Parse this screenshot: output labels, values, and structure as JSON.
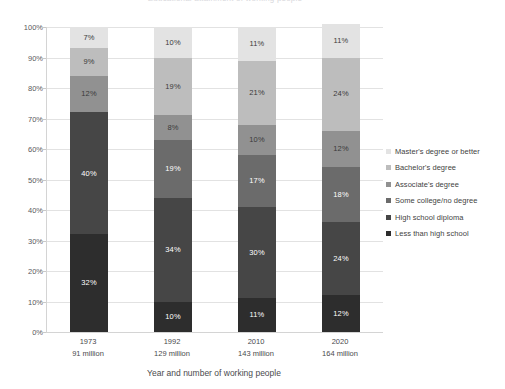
{
  "chart_data": {
    "type": "bar",
    "stacked": true,
    "stack_mode": "percent",
    "title": "Educational attainment of working people",
    "xlabel": "Year and number of working people",
    "ylabel": "",
    "ylim": [
      0,
      100
    ],
    "ytick_labels": [
      "0%",
      "10%",
      "20%",
      "30%",
      "40%",
      "50%",
      "60%",
      "70%",
      "80%",
      "90%",
      "100%"
    ],
    "ytick_values": [
      0,
      10,
      20,
      30,
      40,
      50,
      60,
      70,
      80,
      90,
      100
    ],
    "grid": true,
    "legend_position": "right",
    "categories": [
      "1973",
      "1992",
      "2010",
      "2020"
    ],
    "category_sublabels": [
      "91 million",
      "129 million",
      "143 million",
      "164 million"
    ],
    "series": [
      {
        "name": "Less than high school",
        "color": "#2d2d2d",
        "label_color": "#ffffff",
        "values": [
          32,
          10,
          11,
          12
        ],
        "value_labels": [
          "32%",
          "10%",
          "11%",
          "12%"
        ]
      },
      {
        "name": "High school diploma",
        "color": "#464646",
        "label_color": "#ffffff",
        "values": [
          40,
          34,
          30,
          24
        ],
        "value_labels": [
          "40%",
          "34%",
          "30%",
          "24%"
        ]
      },
      {
        "name": "Some college/no degree",
        "color": "#6b6b6b",
        "label_color": "#ffffff",
        "values": [
          0,
          19,
          17,
          18
        ],
        "value_labels": [
          "",
          "19%",
          "17%",
          "18%"
        ]
      },
      {
        "name": "Associate's degree",
        "color": "#919191",
        "label_color": "#3a3a3a",
        "values": [
          12,
          8,
          10,
          12
        ],
        "value_labels": [
          "12%",
          "8%",
          "10%",
          "12%"
        ]
      },
      {
        "name": "Bachelor's degree",
        "color": "#bdbdbd",
        "label_color": "#3a3a3a",
        "values": [
          9,
          19,
          21,
          24
        ],
        "value_labels": [
          "9%",
          "19%",
          "21%",
          "24%"
        ]
      },
      {
        "name": "Master's degree or better",
        "color": "#e3e3e3",
        "label_color": "#3a3a3a",
        "values": [
          7,
          10,
          11,
          11
        ],
        "value_labels": [
          "7%",
          "10%",
          "11%",
          "11%"
        ]
      }
    ],
    "legend_entries": [
      {
        "label": "Master's degree or better",
        "color": "#e3e3e3"
      },
      {
        "label": "Bachelor's degree",
        "color": "#bdbdbd"
      },
      {
        "label": "Associate's degree",
        "color": "#919191"
      },
      {
        "label": "Some college/no degree",
        "color": "#6b6b6b"
      },
      {
        "label": "High school diploma",
        "color": "#464646"
      },
      {
        "label": "Less than high school",
        "color": "#2d2d2d"
      }
    ]
  }
}
